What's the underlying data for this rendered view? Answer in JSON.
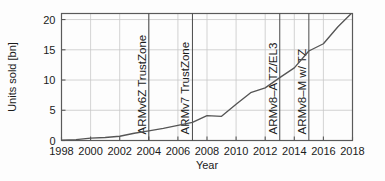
{
  "chart_data": {
    "type": "line",
    "title": "",
    "xlabel": "Year",
    "ylabel": "Units sold [bn]",
    "xlim": [
      1998,
      2018
    ],
    "ylim": [
      0,
      21
    ],
    "grid": true,
    "legend": "none",
    "xticks": [
      "1998",
      "2000",
      "2002",
      "2004",
      "2006",
      "2008",
      "2010",
      "2012",
      "2014",
      "2016",
      "2018"
    ],
    "xtick_values": [
      1998,
      2000,
      2002,
      2004,
      2006,
      2008,
      2010,
      2012,
      2014,
      2016,
      2018
    ],
    "yticks": [
      "0",
      "5",
      "10",
      "15",
      "20"
    ],
    "ytick_values": [
      0,
      5,
      10,
      15,
      20
    ],
    "series": [
      {
        "name": "Units sold",
        "color": "#555555",
        "x": [
          1998,
          1999,
          2000,
          2001,
          2002,
          2003,
          2004,
          2005,
          2006,
          2007,
          2008,
          2009,
          2010,
          2011,
          2012,
          2013,
          2014,
          2015,
          2016,
          2017,
          2018
        ],
        "values": [
          0.05,
          0.15,
          0.4,
          0.5,
          0.7,
          1.2,
          1.6,
          2.0,
          2.5,
          3.0,
          4.1,
          4.0,
          6.0,
          7.9,
          8.7,
          10.4,
          12.0,
          14.8,
          16.0,
          18.8,
          21.2
        ]
      }
    ],
    "annotations": [
      {
        "label": "ARMv6Z TrustZone",
        "x": 2004
      },
      {
        "label": "ARMv7 TrustZone",
        "x": 2007
      },
      {
        "label": "ARMv8–A TZ/EL3",
        "x": 2013
      },
      {
        "label": "ARMv8–M w/ TZ",
        "x": 2015
      }
    ]
  },
  "colors": {
    "line": "#555555",
    "frame": "#5a5a5a",
    "grid": "#c8c8c8",
    "text": "#1b1b1b",
    "background": "#fdfdfd"
  }
}
